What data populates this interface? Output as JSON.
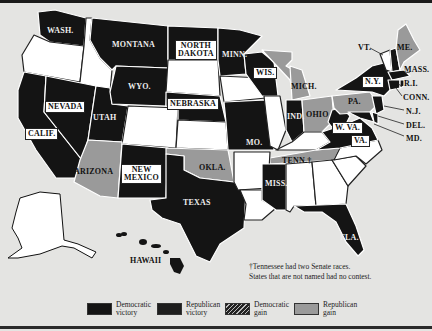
{
  "map": {
    "colors": {
      "democratic_victory": "#141414",
      "republican_victory": "#1e1e1e",
      "democratic_gain": "#2a2a2a",
      "republican_gain": "#9a9a9a",
      "no_contest": "#ffffff",
      "background": "#e4e4e2"
    },
    "state_labels": {
      "wash": "WASH.",
      "montana": "MONTANA",
      "north_dakota_1": "NORTH",
      "north_dakota_2": "DAKOTA",
      "minn": "MINN.",
      "wis": "WIS.",
      "mich": "MICH.",
      "vt": "VT.",
      "me": "ME.",
      "mass": "MASS.",
      "ny": "N.Y.",
      "ri": "R.I.",
      "conn": "CONN.",
      "nj": "N.J.",
      "del": "DEL.",
      "md": "MD.",
      "pa": "PA.",
      "ohio": "OHIO",
      "ind": "IND.",
      "wva": "W. VA.",
      "va": "VA.",
      "wyo": "WYO.",
      "nebraska": "NEBRASKA",
      "nevada": "NEVADA",
      "utah": "UTAH",
      "calif": "CALIF.",
      "mo": "MO.",
      "tenn": "TENN.†",
      "arizona": "ARIZONA",
      "new_mexico_1": "NEW",
      "new_mexico_2": "MEXICO",
      "okla": "OKLA.",
      "texas": "TEXAS",
      "miss": "MISS.",
      "fla": "FLA.",
      "hawaii": "HAWAII"
    },
    "footnote": [
      "†Tennessee had two Senate races.",
      "States that are not named had no contest."
    ],
    "legend": [
      {
        "label_1": "Democratic",
        "label_2": "victory",
        "swatch": "solid-dark"
      },
      {
        "label_1": "Republican",
        "label_2": "victory",
        "swatch": "solid-dark"
      },
      {
        "label_1": "Democratic",
        "label_2": "gain",
        "swatch": "hatched"
      },
      {
        "label_1": "Republican",
        "label_2": "gain",
        "swatch": "gray"
      }
    ]
  }
}
